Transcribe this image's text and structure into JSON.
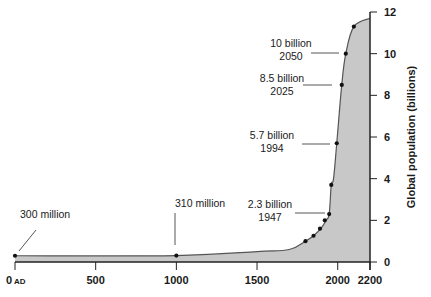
{
  "chart_data": {
    "type": "area",
    "title": "",
    "xlabel": "",
    "ylabel": "Global population (billions)",
    "xlim": [
      0,
      2200
    ],
    "ylim": [
      0,
      12
    ],
    "grid": false,
    "x_ticks": [
      {
        "value": 0,
        "label": "0",
        "suffix": "AD"
      },
      {
        "value": 500,
        "label": "500"
      },
      {
        "value": 1000,
        "label": "1000"
      },
      {
        "value": 1500,
        "label": "1500"
      },
      {
        "value": 2000,
        "label": "2000"
      },
      {
        "value": 2200,
        "label": "2200"
      }
    ],
    "y_ticks": [
      0,
      2,
      4,
      6,
      8,
      10,
      12
    ],
    "series": [
      {
        "name": "Global population",
        "x": [
          0,
          1000,
          1500,
          1700,
          1800,
          1850,
          1900,
          1927,
          1947,
          1960,
          1974,
          1994,
          2025,
          2050,
          2100,
          2200
        ],
        "values": [
          0.3,
          0.31,
          0.5,
          0.6,
          1.0,
          1.26,
          1.65,
          2.0,
          2.3,
          3.7,
          4.0,
          5.7,
          8.5,
          10.0,
          11.3,
          11.7
        ],
        "markers_x": [
          0,
          1000,
          1800,
          1850,
          1890,
          1920,
          1947,
          1960,
          1994,
          2025,
          2050,
          2100
        ],
        "markers_y": [
          0.3,
          0.31,
          1.0,
          1.26,
          1.6,
          2.0,
          2.3,
          3.7,
          5.7,
          8.5,
          10.0,
          11.3
        ]
      }
    ],
    "annotations": [
      {
        "x": 0,
        "y": 0.3,
        "line1": "300 million",
        "line2": ""
      },
      {
        "x": 1000,
        "y": 0.31,
        "line1": "310 million",
        "line2": ""
      },
      {
        "x": 1947,
        "y": 2.3,
        "line1": "2.3 billion",
        "line2": "1947"
      },
      {
        "x": 1994,
        "y": 5.7,
        "line1": "5.7 billion",
        "line2": "1994"
      },
      {
        "x": 2025,
        "y": 8.5,
        "line1": "8.5 billion",
        "line2": "2025"
      },
      {
        "x": 2050,
        "y": 10.0,
        "line1": "10 billion",
        "line2": "2050"
      }
    ],
    "colors": {
      "fill": "#c8c8c8",
      "line": "#555555",
      "axis": "#222222",
      "marker": "#111111"
    }
  }
}
